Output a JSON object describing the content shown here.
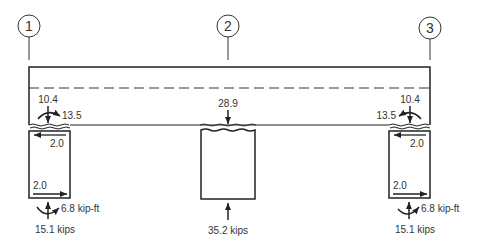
{
  "diagram": {
    "colors": {
      "stroke": "#222222",
      "text": "#333333",
      "background": "#ffffff"
    },
    "gridlines": [
      {
        "id": "1",
        "label": "1"
      },
      {
        "id": "2",
        "label": "2"
      },
      {
        "id": "3",
        "label": "3"
      }
    ],
    "beam_joint_forces": {
      "left": {
        "vertical": "10.4",
        "moment": "13.5",
        "column_top_shear": "2.0"
      },
      "center": {
        "vertical": "28.9"
      },
      "right": {
        "vertical": "10.4",
        "moment": "13.5",
        "column_top_shear": "2.0"
      }
    },
    "column_base_reactions": {
      "left": {
        "shear": "2.0",
        "moment": "6.8 kip-ft",
        "axial": "15.1 kips"
      },
      "center": {
        "axial": "35.2 kips"
      },
      "right": {
        "shear": "2.0",
        "moment": "6.8 kip-ft",
        "axial": "15.1 kips"
      }
    }
  }
}
